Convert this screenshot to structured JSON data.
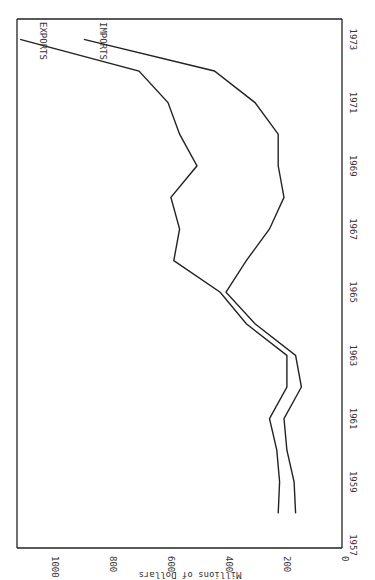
{
  "chart_data": {
    "type": "line",
    "title": "",
    "orientation": "rotated 90 degrees clockwise (time axis vertical, value axis horizontal)",
    "xlabel": "",
    "ylabel": "Millions of Dollars",
    "x_ticks": [
      "1957",
      "1959",
      "1961",
      "1963",
      "1965",
      "1967",
      "1969",
      "1971",
      "1973"
    ],
    "y_ticks": [
      "0",
      "200",
      "400",
      "600",
      "800",
      "1000"
    ],
    "ylim": [
      0,
      1120
    ],
    "grid": false,
    "legend_position": "inline labels at line ends",
    "x": [
      1958,
      1959,
      1960,
      1961,
      1962,
      1963,
      1964,
      1965,
      1966,
      1967,
      1968,
      1969,
      1970,
      1971,
      1972,
      1973
    ],
    "series": [
      {
        "name": "EXPORTS",
        "values": [
          220,
          215,
          225,
          250,
          190,
          190,
          330,
          420,
          580,
          560,
          590,
          500,
          560,
          600,
          700,
          1110
        ]
      },
      {
        "name": "IMPORTS",
        "values": [
          160,
          165,
          190,
          200,
          140,
          160,
          300,
          400,
          330,
          250,
          200,
          220,
          220,
          300,
          440,
          890
        ]
      }
    ]
  },
  "labels": {
    "exports": "EXPORTS",
    "imports": "IMPORTS",
    "axis": "Millions of Dollars"
  }
}
